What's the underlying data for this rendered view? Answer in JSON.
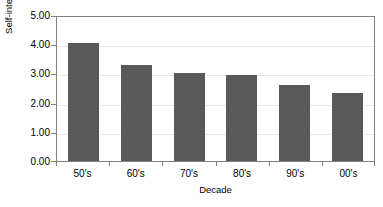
{
  "chart_data": {
    "type": "bar",
    "title": "",
    "subtitle": "",
    "xlabel": "Decade",
    "ylabel": "Self-interest well understood score",
    "categories": [
      "50's",
      "60's",
      "70's",
      "80's",
      "90's",
      "00's"
    ],
    "values": [
      4.05,
      3.3,
      3.0,
      2.93,
      2.62,
      2.33
    ],
    "series": [
      {
        "name": "Self-interest well understood score",
        "values": [
          4.05,
          3.3,
          3.0,
          2.93,
          2.62,
          2.33
        ]
      }
    ],
    "ylim": [
      0.0,
      5.0
    ],
    "ytick_step": 1.0,
    "ytick_labels": [
      "0.00",
      "1.00",
      "2.00",
      "3.00",
      "4.00",
      "5.00"
    ],
    "grid": true,
    "grid_axis": "y",
    "legend": false,
    "legend_position": "none",
    "bar_color": "#595959",
    "gridline_color": "#e8e8e8",
    "axis_color": "#808080",
    "background_color": "#ffffff",
    "text_color": "#000000"
  }
}
